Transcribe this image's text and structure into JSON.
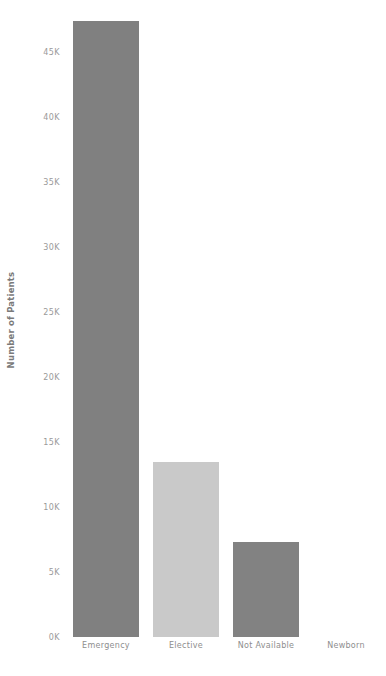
{
  "chart_data": {
    "type": "bar",
    "title": "",
    "subtitle": "",
    "xlabel": "",
    "ylabel": "Number of Patients",
    "categories": [
      "Emergency",
      "Elective",
      "Not Available",
      "Newborn"
    ],
    "values": [
      47400,
      13500,
      7300,
      0
    ],
    "series": [
      {
        "name": "Number of Patients",
        "values": [
          47400,
          13500,
          7300,
          0
        ]
      }
    ],
    "bar_colors": [
      "#808080",
      "#c9c9c9",
      "#828282",
      "#ffffff"
    ],
    "ylim": [
      0,
      49000
    ],
    "yticks": [
      0,
      5000,
      10000,
      15000,
      20000,
      25000,
      30000,
      35000,
      40000,
      45000
    ],
    "ytick_labels": [
      "0K",
      "5K",
      "10K",
      "15K",
      "20K",
      "25K",
      "30K",
      "35K",
      "40K",
      "45K"
    ],
    "grid": false,
    "legend": "none",
    "axis_label_color": "#9a9a9a",
    "axis_title_color": "#7a7a7a",
    "background_color": "#ffffff"
  }
}
